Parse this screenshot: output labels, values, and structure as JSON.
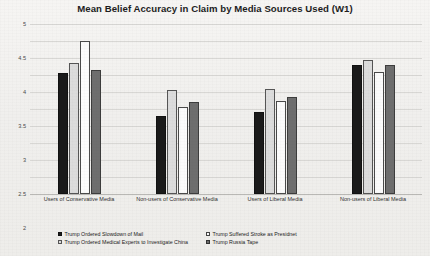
{
  "chart_data": {
    "type": "bar",
    "title": "Mean Belief Accuracy in Claim by Media Sources Used (W1)",
    "xlabel": "",
    "ylabel": "",
    "ylim": [
      0,
      5
    ],
    "yticks": [
      "0",
      "0.5",
      "1",
      "1.5",
      "2",
      "2.5",
      "3",
      "3.5",
      "4",
      "4.5",
      "5"
    ],
    "grid": true,
    "legend_position": "bottom",
    "categories": [
      "Users of Conservative Media",
      "Non-users of Conservative Media",
      "Users of Liberal Media",
      "Non-users of Liberal Media"
    ],
    "series": [
      {
        "name": "Trump Ordered Slowdown of Mail",
        "color": "#1a1a1a",
        "values": [
          3.55,
          2.3,
          2.4,
          3.8
        ]
      },
      {
        "name": "Trump Ordered Medical Experts to Investigate China",
        "color": "#dcdcdc",
        "values": [
          3.85,
          3.05,
          3.1,
          3.95
        ]
      },
      {
        "name": "Trump Suffered Stroke as Presidnet",
        "color": "#fbfbfb",
        "values": [
          4.5,
          2.55,
          2.75,
          3.6
        ]
      },
      {
        "name": "Trump Russia Tape",
        "color": "#6e6e6e",
        "values": [
          3.65,
          2.7,
          2.85,
          3.8
        ]
      }
    ],
    "legend_order": [
      0,
      2,
      1,
      3
    ]
  }
}
